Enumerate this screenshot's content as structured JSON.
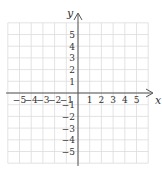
{
  "chart_data": {
    "type": "scatter",
    "title": "",
    "xlabel": "x",
    "ylabel": "y",
    "xlim": [
      -6,
      6
    ],
    "ylim": [
      -6,
      6
    ],
    "grid": true,
    "x_ticks": [
      -5,
      -4,
      -3,
      -2,
      -1,
      1,
      2,
      3,
      4,
      5
    ],
    "y_ticks": [
      5,
      4,
      3,
      2,
      1,
      -1,
      -2,
      -3,
      -4,
      -5
    ],
    "x_tick_labels": [
      "−5",
      "−4",
      "−3",
      "−2",
      "−1",
      "1",
      "2",
      "3",
      "4",
      "5"
    ],
    "y_tick_labels": [
      "5",
      "4",
      "3",
      "2",
      "1",
      "−1",
      "−2",
      "−3",
      "−4",
      "−5"
    ],
    "points": []
  },
  "colors": {
    "grid": "#dcdcdc",
    "axis": "#555555",
    "text": "#333333",
    "background": "#ffffff"
  }
}
